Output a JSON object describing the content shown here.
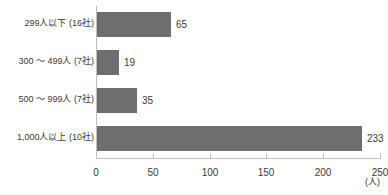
{
  "chart_data": {
    "type": "bar",
    "orientation": "horizontal",
    "title": "",
    "xlabel": "(人)",
    "ylabel": "",
    "categories": [
      "299人以下 (16社)",
      "300 〜 499人 (7社)",
      "500 〜 999人 (7社)",
      "1,000人以上 (10社)"
    ],
    "values": [
      65,
      19,
      35,
      233
    ],
    "value_labels": [
      "65",
      "19",
      "35",
      "233"
    ],
    "xlim": [
      0,
      250
    ],
    "xticks": [
      0,
      50,
      100,
      150,
      200,
      250
    ],
    "xtick_labels": [
      "0",
      "50",
      "100",
      "150",
      "200",
      "250"
    ],
    "grid": false,
    "legend": null,
    "bar_color": "#6e6e6e",
    "axis_color": "#bfbfbf",
    "text_color": "#3a3a3a"
  }
}
